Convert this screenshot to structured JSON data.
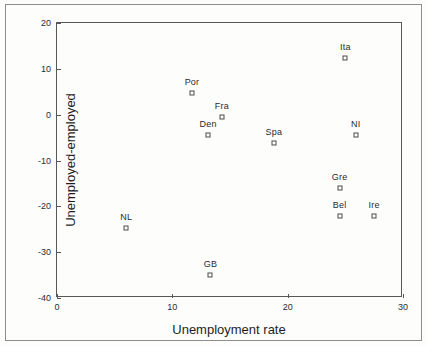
{
  "chart_data": {
    "type": "scatter",
    "title": "",
    "xlabel": "Unemployment rate",
    "ylabel": "Unemployed-employed",
    "xlim": [
      0,
      30
    ],
    "ylim": [
      -40,
      20
    ],
    "xticks": [
      0,
      10,
      20,
      30
    ],
    "yticks": [
      20,
      10,
      0,
      -10,
      -20,
      -30,
      -40
    ],
    "xtick_labels": [
      "0",
      "10",
      "20",
      "30"
    ],
    "ytick_labels": [
      "20",
      "10",
      "0",
      "-10",
      "-20",
      "-30",
      "-40"
    ],
    "grid": false,
    "legend": "none",
    "marker": "open-square",
    "points": [
      {
        "label": "Ita",
        "x": 25.0,
        "y": 12.4
      },
      {
        "label": "Por",
        "x": 11.7,
        "y": 4.7
      },
      {
        "label": "Fra",
        "x": 14.3,
        "y": -0.4
      },
      {
        "label": "Den",
        "x": 13.1,
        "y": -4.5
      },
      {
        "label": "NI",
        "x": 25.9,
        "y": -4.4
      },
      {
        "label": "Spa",
        "x": 18.8,
        "y": -6.2
      },
      {
        "label": "Gre",
        "x": 24.5,
        "y": -15.9
      },
      {
        "label": "Bel",
        "x": 24.5,
        "y": -22.1
      },
      {
        "label": "Ire",
        "x": 27.5,
        "y": -22.0
      },
      {
        "label": "NL",
        "x": 6.0,
        "y": -24.8
      },
      {
        "label": "GB",
        "x": 13.3,
        "y": -35.0
      }
    ]
  },
  "colors": {
    "axis": "#585858",
    "text": "#1d1d1d",
    "marker_edge": "#4a4a4a",
    "background": "#fdfdfc",
    "frame": "#8e8e8e"
  }
}
